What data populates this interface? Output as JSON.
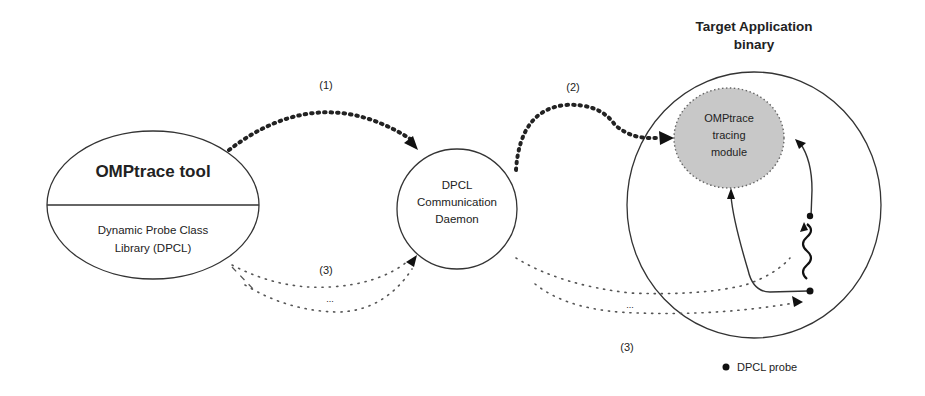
{
  "diagram": {
    "nodes": {
      "omptrace_tool": {
        "title": "OMPtrace tool",
        "subtitle_line1": "Dynamic Probe Class",
        "subtitle_line2": "Library (DPCL)"
      },
      "dpcl_daemon": {
        "line1": "DPCL",
        "line2": "Communication",
        "line3": "Daemon"
      },
      "target_application": {
        "title_line1": "Target Application",
        "title_line2": "binary"
      },
      "tracing_module": {
        "line1": "OMPtrace",
        "line2": "tracing",
        "line3": "module",
        "fill_color": "#c8c8c8"
      }
    },
    "edges": {
      "step1_label": "(1)",
      "step2_label": "(2)",
      "step3_label_left": "(3)",
      "step3_label_right": "(3)",
      "ellipsis_left": "...",
      "ellipsis_right": "..."
    },
    "legend": {
      "probe_label": "DPCL probe"
    },
    "colors": {
      "stroke": "#333333",
      "module_fill": "#c8c8c8",
      "background": "#ffffff"
    }
  }
}
